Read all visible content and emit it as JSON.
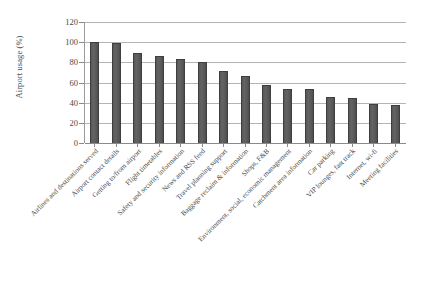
{
  "chart_data": {
    "type": "bar",
    "title": "",
    "xlabel": "",
    "ylabel": "Airport usage (%)",
    "ylim": [
      0,
      120
    ],
    "yticks": [
      0,
      20,
      40,
      60,
      80,
      100,
      120
    ],
    "grid": true,
    "legend": false,
    "orientation": "vertical",
    "bar_color": "#5a5a5a",
    "bar_edge_color": "#3f3f3f",
    "categories": [
      "Airlines and destinations served",
      "Airport contact details",
      "Getting to/from airport",
      "Flight timetables",
      "Safety and security information",
      "News and RSS feed",
      "Travel planning support",
      "Baggage reclaim & information",
      "Shops, F&B",
      "Environment, social, economic management",
      "Catchment area information",
      "Car parking",
      "VIP lounges, fast track",
      "Internet, wi-fi",
      "Meeting facilities"
    ],
    "values": [
      100,
      99,
      89,
      86,
      83,
      80,
      71,
      66,
      58,
      54,
      54,
      46,
      45,
      39,
      38
    ]
  }
}
